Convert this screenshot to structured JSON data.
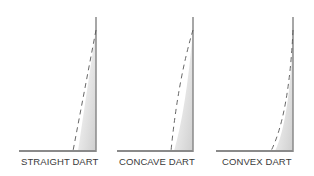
{
  "figures": [
    {
      "id": "straight",
      "label": "STRAIGHT DART",
      "shape": "straight"
    },
    {
      "id": "concave",
      "label": "CONCAVE DART",
      "shape": "concave"
    },
    {
      "id": "convex",
      "label": "CONVEX DART",
      "shape": "convex"
    }
  ],
  "colors": {
    "line": "#8a8a8a",
    "dash": "#555555",
    "shade": "#d8d8d8",
    "text": "#3a3a3a"
  }
}
